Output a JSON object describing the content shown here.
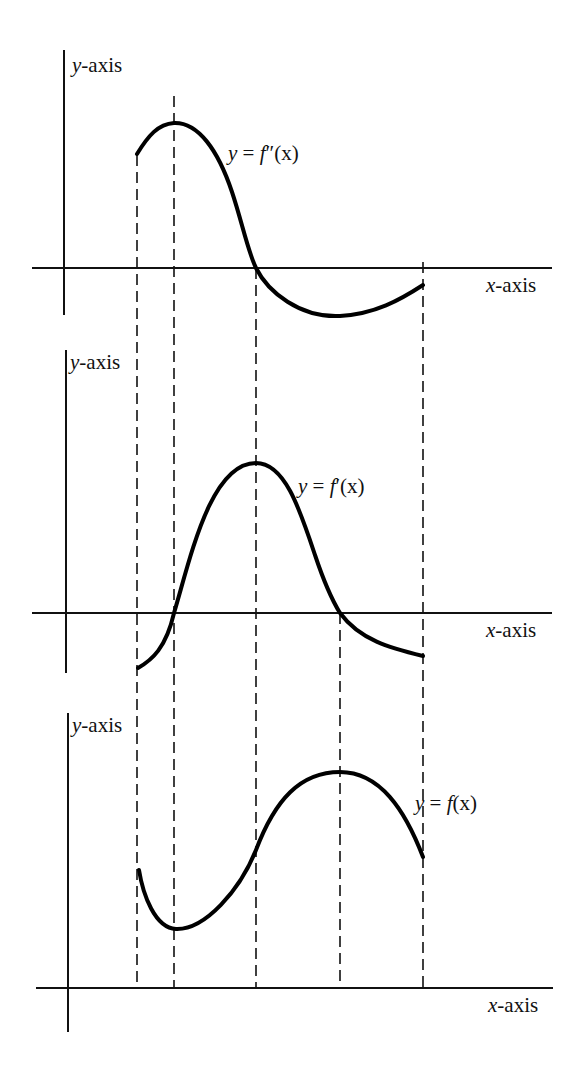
{
  "figure": {
    "panels": [
      {
        "id": "second-derivative",
        "y_axis_label_var": "y",
        "y_axis_label_rest": "-axis",
        "x_axis_label_var": "x",
        "x_axis_label_rest": "-axis",
        "curve_label": "y = f″(x)",
        "curve_label_parts": {
          "lhs": "y",
          "eq": " = ",
          "fn": "f",
          "prime": "″",
          "arg": "(x)"
        }
      },
      {
        "id": "first-derivative",
        "y_axis_label_var": "y",
        "y_axis_label_rest": "-axis",
        "x_axis_label_var": "x",
        "x_axis_label_rest": "-axis",
        "curve_label": "y = f′(x)",
        "curve_label_parts": {
          "lhs": "y",
          "eq": " = ",
          "fn": "f",
          "prime": "′",
          "arg": "(x)"
        }
      },
      {
        "id": "function",
        "y_axis_label_var": "y",
        "y_axis_label_rest": "-axis",
        "x_axis_label_var": "x",
        "x_axis_label_rest": "-axis",
        "curve_label": "y = f(x)",
        "curve_label_parts": {
          "lhs": "y",
          "eq": " = ",
          "fn": "f",
          "prime": "",
          "arg": "(x)"
        }
      }
    ],
    "guide_lines_x_px": [
      137,
      174,
      256,
      340,
      423
    ],
    "colors": {
      "ink": "#000000",
      "background": "#ffffff"
    }
  }
}
